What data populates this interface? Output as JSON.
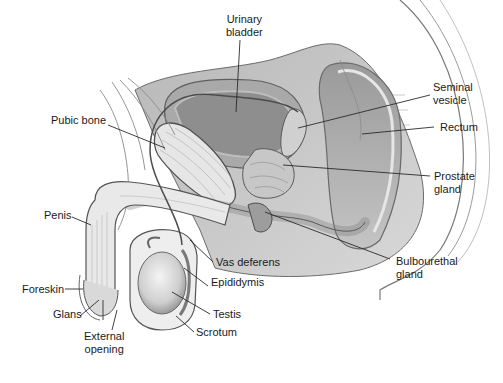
{
  "figure": {
    "labels": [
      {
        "id": "urinary-bladder",
        "text": "Urinary\nbladder",
        "x": 227,
        "y": 13
      },
      {
        "id": "pubic-bone",
        "text": "Pubic bone",
        "x": 51,
        "y": 114
      },
      {
        "id": "seminal-vesicle",
        "text": "Seminal\nvesicle",
        "x": 433,
        "y": 81
      },
      {
        "id": "rectum",
        "text": "Rectum",
        "x": 440,
        "y": 121
      },
      {
        "id": "prostate-gland",
        "text": "Prostate\ngland",
        "x": 434,
        "y": 170
      },
      {
        "id": "penis",
        "text": "Penis",
        "x": 44,
        "y": 209
      },
      {
        "id": "bulbourethral-gland",
        "text": "Bulbourethal\ngland",
        "x": 396,
        "y": 255
      },
      {
        "id": "vas-deferens",
        "text": "Vas deferens",
        "x": 216,
        "y": 256
      },
      {
        "id": "epididymis",
        "text": "Epididymis",
        "x": 211,
        "y": 276
      },
      {
        "id": "foreskin",
        "text": "Foreskin",
        "x": 22,
        "y": 283
      },
      {
        "id": "testis",
        "text": "Testis",
        "x": 213,
        "y": 308
      },
      {
        "id": "glans",
        "text": "Glans",
        "x": 53,
        "y": 308
      },
      {
        "id": "scrotum",
        "text": "Scrotum",
        "x": 196,
        "y": 326
      },
      {
        "id": "external-opening",
        "text": "External\nopening",
        "x": 84,
        "y": 330
      }
    ]
  }
}
